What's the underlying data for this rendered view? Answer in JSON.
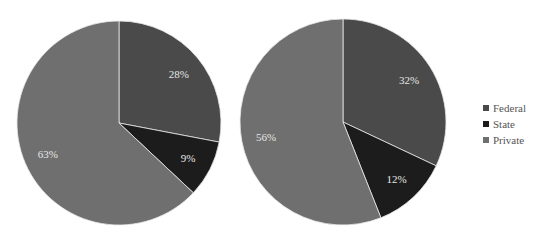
{
  "chart_data": [
    {
      "type": "pie",
      "title": "",
      "categories": [
        "Federal",
        "State",
        "Private"
      ],
      "values": [
        28,
        9,
        63
      ],
      "labels": [
        "28%",
        "9%",
        "63%"
      ]
    },
    {
      "type": "pie",
      "title": "",
      "categories": [
        "Federal",
        "State",
        "Private"
      ],
      "values": [
        32,
        12,
        56
      ],
      "labels": [
        "32%",
        "12%",
        "56%"
      ]
    }
  ],
  "legend": {
    "position": "right",
    "items": [
      {
        "label": "Federal",
        "color": "#4a4a4a"
      },
      {
        "label": "State",
        "color": "#1c1c1c"
      },
      {
        "label": "Private",
        "color": "#6f6f6f"
      }
    ]
  },
  "colors": [
    "#4a4a4a",
    "#1c1c1c",
    "#6f6f6f"
  ]
}
